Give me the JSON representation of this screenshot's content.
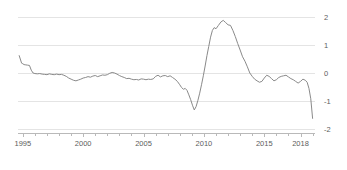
{
  "chart_data": {
    "type": "line",
    "title": "",
    "subtitle": "",
    "xlabel": "",
    "ylabel": "",
    "xlim": [
      1994.6,
      2019.2
    ],
    "ylim": [
      -2,
      2
    ],
    "grid": true,
    "legend": null,
    "y_axis_position": "right",
    "y_ticks": [
      2,
      1,
      0,
      -1,
      -2
    ],
    "y_tick_labels": [
      "2",
      "1",
      "0",
      "-1",
      "-2"
    ],
    "x_ticks": [
      1995,
      2000,
      2005,
      2010,
      2015,
      2018
    ],
    "x_tick_labels": [
      "1995",
      "2000",
      "2005",
      "2010",
      "2015",
      "2018"
    ],
    "x_minor_tick_interval": 1,
    "series": [
      {
        "name": "series-1",
        "color": "#8a8a8a",
        "x": [
          1994.7,
          1994.9,
          1995.0,
          1995.1,
          1995.25,
          1995.4,
          1995.55,
          1995.7,
          1995.85,
          1996.0,
          1996.2,
          1996.4,
          1996.6,
          1996.8,
          1997.0,
          1997.2,
          1997.4,
          1997.6,
          1997.8,
          1998.0,
          1998.2,
          1998.4,
          1998.6,
          1998.8,
          1999.0,
          1999.2,
          1999.4,
          1999.6,
          1999.8,
          2000.0,
          2000.2,
          2000.4,
          2000.6,
          2000.8,
          2001.0,
          2001.2,
          2001.4,
          2001.6,
          2001.8,
          2002.0,
          2002.2,
          2002.4,
          2002.6,
          2002.8,
          2003.0,
          2003.2,
          2003.4,
          2003.6,
          2003.8,
          2004.0,
          2004.2,
          2004.4,
          2004.6,
          2004.8,
          2005.0,
          2005.2,
          2005.4,
          2005.6,
          2005.8,
          2006.0,
          2006.2,
          2006.4,
          2006.6,
          2006.8,
          2007.0,
          2007.2,
          2007.4,
          2007.6,
          2007.8,
          2008.0,
          2008.15,
          2008.3,
          2008.45,
          2008.6,
          2008.75,
          2008.9,
          2009.05,
          2009.2,
          2009.35,
          2009.5,
          2009.65,
          2009.8,
          2009.95,
          2010.1,
          2010.25,
          2010.4,
          2010.55,
          2010.7,
          2010.85,
          2011.0,
          2011.2,
          2011.4,
          2011.6,
          2011.8,
          2012.0,
          2012.2,
          2012.4,
          2012.6,
          2012.8,
          2013.0,
          2013.2,
          2013.4,
          2013.6,
          2013.8,
          2014.0,
          2014.2,
          2014.4,
          2014.6,
          2014.8,
          2015.0,
          2015.2,
          2015.4,
          2015.6,
          2015.8,
          2016.0,
          2016.2,
          2016.4,
          2016.6,
          2016.8,
          2017.0,
          2017.2,
          2017.4,
          2017.6,
          2017.8,
          2018.0,
          2018.2,
          2018.4,
          2018.55,
          2018.7,
          2018.85,
          2019.0
        ],
        "y": [
          0.62,
          0.35,
          0.33,
          0.3,
          0.29,
          0.28,
          0.27,
          0.1,
          0.0,
          -0.02,
          -0.03,
          -0.02,
          -0.04,
          -0.05,
          -0.06,
          -0.03,
          -0.05,
          -0.06,
          -0.04,
          -0.06,
          -0.05,
          -0.08,
          -0.12,
          -0.18,
          -0.22,
          -0.26,
          -0.28,
          -0.25,
          -0.22,
          -0.18,
          -0.16,
          -0.13,
          -0.15,
          -0.11,
          -0.09,
          -0.13,
          -0.1,
          -0.07,
          -0.08,
          -0.06,
          -0.01,
          0.02,
          0.0,
          -0.04,
          -0.09,
          -0.13,
          -0.16,
          -0.2,
          -0.19,
          -0.22,
          -0.24,
          -0.23,
          -0.25,
          -0.21,
          -0.22,
          -0.24,
          -0.22,
          -0.23,
          -0.21,
          -0.12,
          -0.08,
          -0.14,
          -0.1,
          -0.09,
          -0.13,
          -0.1,
          -0.16,
          -0.22,
          -0.3,
          -0.42,
          -0.52,
          -0.58,
          -0.55,
          -0.62,
          -0.78,
          -0.95,
          -1.15,
          -1.32,
          -1.2,
          -0.98,
          -0.72,
          -0.42,
          -0.1,
          0.25,
          0.62,
          0.95,
          1.28,
          1.52,
          1.62,
          1.58,
          1.7,
          1.82,
          1.88,
          1.8,
          1.72,
          1.7,
          1.52,
          1.3,
          1.05,
          0.82,
          0.58,
          0.42,
          0.22,
          0.0,
          -0.12,
          -0.22,
          -0.28,
          -0.33,
          -0.3,
          -0.18,
          -0.08,
          -0.12,
          -0.2,
          -0.28,
          -0.24,
          -0.16,
          -0.12,
          -0.1,
          -0.08,
          -0.14,
          -0.2,
          -0.24,
          -0.3,
          -0.36,
          -0.3,
          -0.22,
          -0.26,
          -0.33,
          -0.55,
          -0.92,
          -1.62
        ]
      }
    ]
  }
}
